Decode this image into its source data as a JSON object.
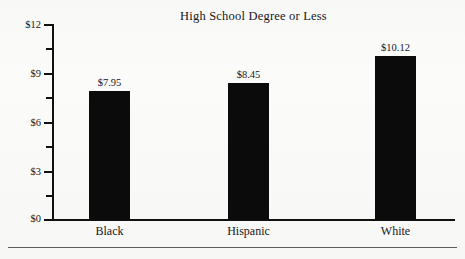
{
  "chart_data": {
    "type": "bar",
    "title": "High School Degree or Less",
    "xlabel": "",
    "ylabel": "",
    "categories": [
      "Black",
      "Hispanic",
      "White"
    ],
    "values": [
      7.95,
      8.45,
      10.12
    ],
    "value_labels": [
      "$7.95",
      "$8.45",
      "$10.12"
    ],
    "ylim": [
      0,
      12
    ],
    "y_major_ticks": [
      0,
      3,
      6,
      9,
      12
    ],
    "y_major_tick_labels": [
      "$0",
      "$3",
      "$6",
      "$9",
      "$12"
    ],
    "y_minor_ticks": [
      1.5,
      4.5,
      7.5,
      10.5
    ],
    "grid": false,
    "legend": null,
    "bar_color": "#0b0b0b",
    "axis_color": "#111111",
    "background": "#fbfbfa"
  },
  "axis": {
    "labels": [
      {
        "text": "$12",
        "value": 12
      },
      {
        "text": "$9",
        "value": 9
      },
      {
        "text": "$6",
        "value": 6
      },
      {
        "text": "$3",
        "value": 3
      },
      {
        "text": "$0",
        "value": 0
      }
    ]
  },
  "bars": [
    {
      "category": "Black",
      "value_label": "$7.95",
      "value": 7.95
    },
    {
      "category": "Hispanic",
      "value_label": "$8.45",
      "value": 8.45
    },
    {
      "category": "White",
      "value_label": "$10.12",
      "value": 10.12
    }
  ]
}
